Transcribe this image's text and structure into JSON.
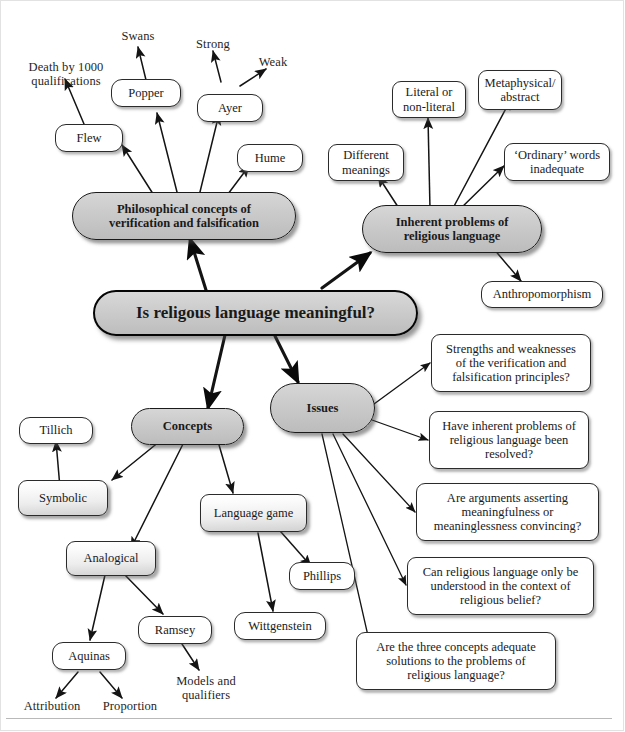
{
  "diagram": {
    "title": "Is religous language meaningful?",
    "accent_gray": "#c8c8c8",
    "line_color": "#1a1a1a",
    "nodes": {
      "center": "Is religous language meaningful?",
      "branch_verification": "Philosophical concepts of\nverification and falsification",
      "branch_inherent": "Inherent problems of\nreligious language",
      "branch_concepts": "Concepts",
      "branch_issues": "Issues",
      "flew": "Flew",
      "popper": "Popper",
      "ayer": "Ayer",
      "hume": "Hume",
      "death_by_1000": "Death by 1000\nqualifications",
      "swans": "Swans",
      "strong": "Strong",
      "weak": "Weak",
      "different_meanings": "Different\nmeanings",
      "literal_or_non_literal": "Literal or\nnon-literal",
      "metaphysical_abstract": "Metaphysical/\nabstract",
      "ordinary_words_inadequate": "‘Ordinary’ words\ninadequate",
      "anthropomorphism": "Anthropomorphism",
      "tillich": "Tillich",
      "symbolic": "Symbolic",
      "analogical": "Analogical",
      "aquinas": "Aquinas",
      "attribution": "Attribution",
      "proportion": "Proportion",
      "ramsey": "Ramsey",
      "models_and_qualifiers": "Models and\nqualifiers",
      "language_game": "Language game",
      "phillips": "Phillips",
      "wittgenstein": "Wittgenstein",
      "q_strengths": "Strengths and weaknesses\nof the verification and\nfalsification principles?",
      "q_resolved": "Have inherent problems of\nreligious language been\nresolved?",
      "q_convincing": "Are arguments asserting\nmeaningfulness or\nmeaninglessness convincing?",
      "q_context": "Can religious language only be\nunderstood in the context of\nreligious belief?",
      "q_adequate": "Are the three concepts adequate\nsolutions to the problems of\nreligious language?"
    }
  }
}
